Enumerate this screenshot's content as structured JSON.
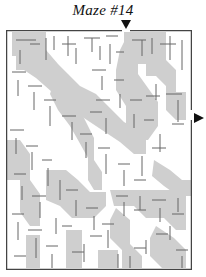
{
  "puzzle": {
    "title": "Maze #14",
    "entry_marker": "down-arrow-top",
    "exit_marker": "right-arrow-side"
  },
  "colors": {
    "wall": "#555555",
    "shade": "#cfcfcf",
    "background": "#ffffff"
  }
}
